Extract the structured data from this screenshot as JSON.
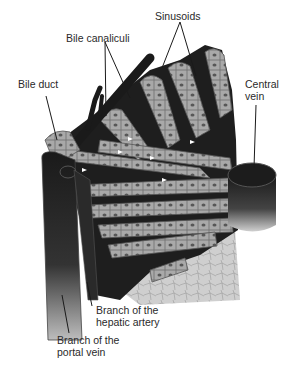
{
  "diagram": {
    "labels": {
      "sinusoids": "Sinusoids",
      "bile_canaliculi": "Bile canaliculi",
      "bile_duct": "Bile duct",
      "central_vein_1": "Central",
      "central_vein_2": "vein",
      "hepatic_artery_1": "Branch of the",
      "hepatic_artery_2": "hepatic artery",
      "portal_vein_1": "Branch of the",
      "portal_vein_2": "portal vein"
    },
    "colors": {
      "background": "#ffffff",
      "cell": "#a8a8a8",
      "cell_border": "#6a6a6a",
      "nucleus": "#555555",
      "sinusoid": "#1e1e1e",
      "vessel": "#222222",
      "tissue": "#c9c9c9"
    }
  }
}
